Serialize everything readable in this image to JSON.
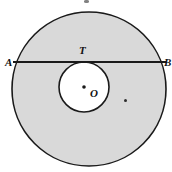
{
  "figure": {
    "kind": "geometry-diagram",
    "canvas": {
      "width": 172,
      "height": 172,
      "background": "#ffffff"
    },
    "colors": {
      "shaded_region": "#d9d9d9",
      "inner_region": "#ffffff",
      "stroke": "#1a1a1a",
      "chord": "#1a1a1a",
      "label": "#111111"
    },
    "outer_circle": {
      "cx": 89,
      "cy": 89,
      "r": 77,
      "stroke_width": 1.6,
      "fill": "#d9d9d9"
    },
    "inner_circle": {
      "cx": 84,
      "cy": 87,
      "r": 25,
      "stroke_width": 1.6,
      "fill": "#ffffff"
    },
    "chord": {
      "x1": 13,
      "y1": 62,
      "x2": 166,
      "y2": 62,
      "stroke_width": 1.8
    },
    "center_dot": {
      "cx": 84,
      "cy": 87,
      "r": 1.8
    },
    "labels": {
      "left_endpoint": "A",
      "right_endpoint": "B",
      "tangent_point": "T",
      "center": "O"
    },
    "marks": {
      "top_speck": "scan-artifact-dot",
      "right_speck": "stray-dot"
    }
  }
}
